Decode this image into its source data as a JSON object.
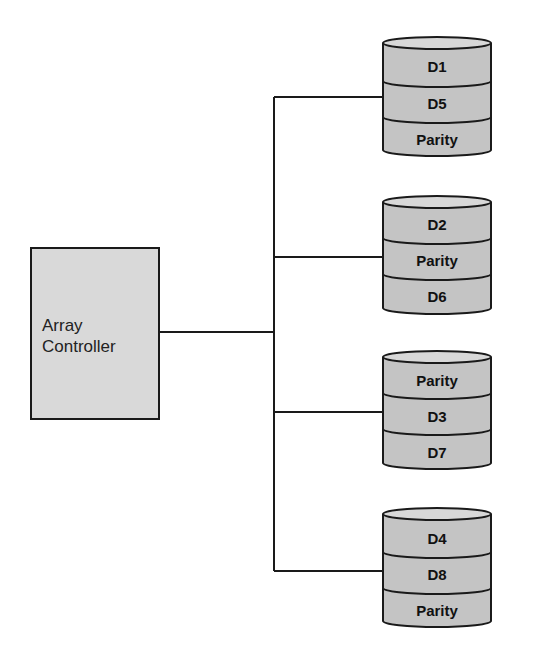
{
  "diagram": {
    "type": "RAID 5 striping with distributed parity",
    "controller": {
      "line1": "Array",
      "line2": "Controller"
    },
    "colors": {
      "disk_fill": "#c4c4c4",
      "disk_top": "#d8d8d8",
      "controller_fill": "#d9d9d9",
      "stroke": "#1a1a1a"
    },
    "disks": [
      {
        "blocks": [
          "D1",
          "D5",
          "Parity"
        ]
      },
      {
        "blocks": [
          "D2",
          "Parity",
          "D6"
        ]
      },
      {
        "blocks": [
          "Parity",
          "D3",
          "D7"
        ]
      },
      {
        "blocks": [
          "D4",
          "D8",
          "Parity"
        ]
      }
    ]
  }
}
